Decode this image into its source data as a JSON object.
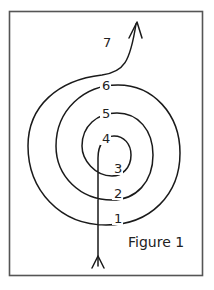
{
  "figure": {
    "caption": "Figure 1",
    "frame_color": "#555555",
    "line_color": "#1a1a1a",
    "labels": [
      {
        "id": "label-1",
        "text": "1",
        "x": 114,
        "y": 223
      },
      {
        "id": "label-2",
        "text": "2",
        "x": 114,
        "y": 198
      },
      {
        "id": "label-3",
        "text": "3",
        "x": 114,
        "y": 173
      },
      {
        "id": "label-4",
        "text": "4",
        "x": 102,
        "y": 143
      },
      {
        "id": "label-5",
        "text": "5",
        "x": 102,
        "y": 118
      },
      {
        "id": "label-6",
        "text": "6",
        "x": 102,
        "y": 90
      },
      {
        "id": "label-7",
        "text": "7",
        "x": 103,
        "y": 47
      }
    ]
  }
}
